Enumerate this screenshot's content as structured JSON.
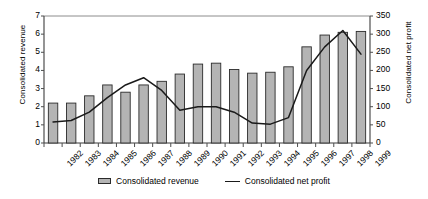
{
  "chart_data": {
    "type": "bar",
    "title": "",
    "xlabel": "",
    "ylabel": "Consolidated revenue",
    "y2label": "Consolidated  net profit",
    "grid": false,
    "legend_position": "bottom",
    "categories": [
      "1982",
      "1983",
      "1984",
      "1985",
      "1986",
      "1987",
      "1988",
      "1989",
      "1990",
      "1991",
      "1992",
      "1993",
      "1994",
      "1995",
      "1996",
      "1997",
      "1998",
      "1999"
    ],
    "ylim": [
      0,
      7
    ],
    "yticks": [
      0,
      1,
      2,
      3,
      4,
      5,
      6,
      7
    ],
    "y2lim": [
      0,
      350
    ],
    "y2ticks": [
      0,
      50,
      100,
      150,
      200,
      250,
      300,
      350
    ],
    "series": [
      {
        "name": "Consolidated revenue",
        "type": "bar",
        "axis": "left",
        "color": "#b4b4b4",
        "edge_color": "#2b2b2b",
        "values": [
          2.2,
          2.2,
          2.6,
          3.2,
          2.8,
          3.2,
          3.4,
          3.8,
          4.35,
          4.4,
          4.05,
          3.85,
          3.9,
          4.2,
          5.3,
          5.95,
          6.1,
          6.15
        ]
      },
      {
        "name": "Consolidated net profit",
        "type": "line",
        "axis": "right",
        "color": "#1a1a1a",
        "values": [
          58,
          62,
          85,
          125,
          160,
          180,
          145,
          90,
          100,
          100,
          85,
          55,
          52,
          70,
          200,
          265,
          310,
          245
        ]
      }
    ]
  },
  "legend": {
    "items": [
      {
        "label": "Consolidated revenue",
        "marker": "bar-swatch"
      },
      {
        "label": "Consolidated net profit",
        "marker": "line-swatch"
      }
    ]
  }
}
